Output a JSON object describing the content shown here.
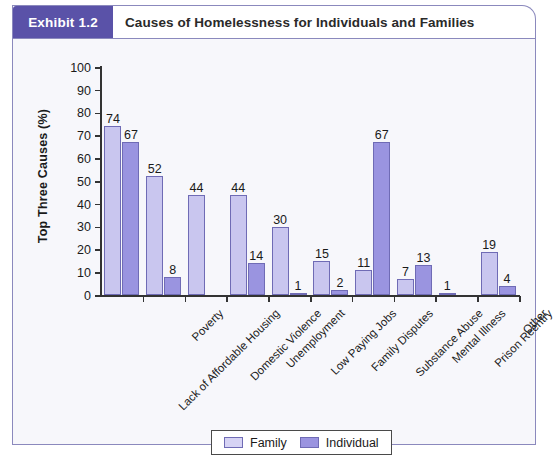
{
  "exhibit": {
    "badge": "Exhibit 1.2",
    "title": "Causes of Homelessness for Individuals and Families"
  },
  "chart_data": {
    "type": "bar",
    "title": "Causes of Homelessness for Individuals and Families",
    "xlabel": "",
    "ylabel": "Top Three Causes (%)",
    "ylim": [
      0,
      100
    ],
    "ytick_step": 10,
    "yticks": [
      0,
      10,
      20,
      30,
      40,
      50,
      60,
      70,
      80,
      90,
      100
    ],
    "grid": false,
    "legend_position": "bottom-center",
    "categories": [
      "Lack of Affordable Housing",
      "Poverty",
      "Domestic Violence",
      "Unemployment",
      "Low Paying Jobs",
      "Family Disputes",
      "Substance Abuse",
      "Mental Illness",
      "Prison Reentry",
      "Other"
    ],
    "series": [
      {
        "name": "Family",
        "color": "#c9c6ef",
        "values": [
          74,
          52,
          44,
          44,
          30,
          15,
          11,
          7,
          1,
          19
        ],
        "labels": [
          "74",
          "52",
          "44",
          "44",
          "30",
          "15",
          "11",
          "7",
          "1",
          "19"
        ]
      },
      {
        "name": "Individual",
        "color": "#9a94e0",
        "values": [
          67,
          8,
          0,
          14,
          1,
          2,
          67,
          13,
          0,
          4
        ],
        "labels": [
          "67",
          "8",
          "",
          "14",
          "1",
          "2",
          "67",
          "13",
          "",
          "4"
        ]
      }
    ]
  },
  "colors": {
    "badge_background": "#5a52a8",
    "frame_border": "#8b89bd",
    "panel_background": "#f7f7fb",
    "family_bar": "#c9c6ef",
    "individual_bar": "#9a94e0",
    "bar_border": "#6f6bb5"
  }
}
